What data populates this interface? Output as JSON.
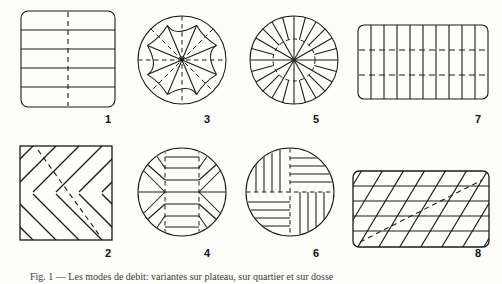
{
  "plate": {
    "background_color": "#fdfdfc",
    "ink_color": "#1a1a18",
    "caption_text": "Fig. 1 — Les modes de debit: variantes sur plateau, sur quartier et sur dosse",
    "figure_count": 8
  },
  "figures": [
    {
      "label": "1",
      "name": "figure-1-square-horizontal-bands",
      "shape": "rounded-square",
      "description": "Rounded square cross-section with five horizontal bands and a vertical dashed centre line",
      "solid_divisions": 4,
      "dashed_lines": 1,
      "dashed_orientation": "vertical",
      "label_x": 108,
      "label_y": 118
    },
    {
      "label": "2",
      "name": "figure-2-square-diamond-lattice",
      "shape": "square",
      "description": "Square cross-section filled with a diagonal diamond lattice and one dashed diagonal",
      "solid_divisions": 14,
      "dashed_lines": 1,
      "dashed_orientation": "diagonal",
      "label_x": 108,
      "label_y": 252
    },
    {
      "label": "3",
      "name": "figure-3-circle-star-rosette",
      "shape": "circle",
      "description": "Round cross-section with an eight-point star rosette and eight radial dashed lines",
      "solid_divisions": 16,
      "dashed_lines": 8,
      "dashed_orientation": "radial",
      "label_x": 207,
      "label_y": 118
    },
    {
      "label": "4",
      "name": "figure-4-circle-central-blocks",
      "shape": "circle",
      "description": "Round cross-section with a horizontal midline, radial side sectors and stacked central blocks between two vertical dashed lines",
      "solid_divisions": 13,
      "dashed_lines": 2,
      "dashed_orientation": "vertical",
      "label_x": 207,
      "label_y": 252
    },
    {
      "label": "5",
      "name": "figure-5-circle-radial-sectors",
      "shape": "circle",
      "description": "Round cross-section with twelve radial lines, intermediate outer staves and a dashed inner circle",
      "solid_divisions": 24,
      "dashed_lines": 1,
      "dashed_orientation": "inner-circle",
      "label_x": 316,
      "label_y": 118
    },
    {
      "label": "6",
      "name": "figure-6-circle-pinwheel-quadrants",
      "shape": "circle",
      "description": "Round cross-section split into four pinwheel quadrants of alternating parallel cuts, divided by dashed cross lines",
      "solid_divisions": 16,
      "dashed_lines": 2,
      "dashed_orientation": "cross",
      "label_x": 316,
      "label_y": 252
    },
    {
      "label": "7",
      "name": "figure-7-rectangle-vertical-staves",
      "shape": "rounded-rectangle",
      "description": "Rounded rectangular cross-section with ten vertical staves crossed by two horizontal dashed lines",
      "solid_divisions": 10,
      "dashed_lines": 2,
      "dashed_orientation": "horizontal",
      "label_x": 478,
      "label_y": 118
    },
    {
      "label": "8",
      "name": "figure-8-rectangle-diagonal-hatch",
      "shape": "rounded-rectangle",
      "description": "Rounded rectangular cross-section with five horizontal courses crossed by rising diagonal cuts and one dashed diagonal",
      "solid_divisions": 14,
      "dashed_lines": 1,
      "dashed_orientation": "diagonal",
      "label_x": 478,
      "label_y": 252
    }
  ]
}
